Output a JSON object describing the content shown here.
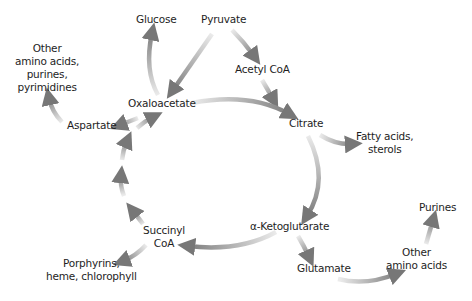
{
  "diagram": {
    "title": "",
    "colors": {
      "background": "#ffffff",
      "text": "#1e1e1e",
      "arrow": "#7a7a7a",
      "arrow_fade": "#e6e6e6"
    },
    "nodes": {
      "glucose": {
        "label": "Glucose"
      },
      "pyruvate": {
        "label": "Pyruvate"
      },
      "acetyl_coa": {
        "label": "Acetyl CoA"
      },
      "other_amino_acids_left": {
        "lines": [
          "Other",
          "amino acids,",
          "purines,",
          "pyrimidines"
        ]
      },
      "oxaloacetate": {
        "label": "Oxaloacetate"
      },
      "aspartate": {
        "label": "Aspartate"
      },
      "citrate": {
        "label": "Citrate"
      },
      "fatty_acids": {
        "lines": [
          "Fatty acids,",
          "sterols"
        ]
      },
      "alpha_ketoglutarate": {
        "label": "α-Ketoglutarate"
      },
      "succinyl_coa": {
        "lines": [
          "Succinyl",
          "CoA"
        ]
      },
      "porphyrins": {
        "lines": [
          "Porphyrins,",
          "heme, chlorophyll"
        ]
      },
      "glutamate": {
        "label": "Glutamate"
      },
      "other_amino_acids_right": {
        "lines": [
          "Other",
          "amino acids"
        ]
      },
      "purines": {
        "label": "Purines"
      }
    },
    "edges": [
      {
        "from": "Pyruvate",
        "to": "Acetyl CoA"
      },
      {
        "from": "Pyruvate",
        "to": "Oxaloacetate"
      },
      {
        "from": "Acetyl CoA",
        "to": "Citrate"
      },
      {
        "from": "Oxaloacetate",
        "to": "Citrate"
      },
      {
        "from": "Oxaloacetate",
        "to": "Glucose"
      },
      {
        "from": "Oxaloacetate",
        "to": "Aspartate"
      },
      {
        "from": "Aspartate",
        "to": "Other amino acids, purines, pyrimidines"
      },
      {
        "from": "Citrate",
        "to": "Fatty acids, sterols"
      },
      {
        "from": "Citrate",
        "to": "α-Ketoglutarate"
      },
      {
        "from": "α-Ketoglutarate",
        "to": "Succinyl CoA"
      },
      {
        "from": "α-Ketoglutarate",
        "to": "Glutamate"
      },
      {
        "from": "Glutamate",
        "to": "Other amino acids"
      },
      {
        "from": "Other amino acids",
        "to": "Purines"
      },
      {
        "from": "Succinyl CoA",
        "to": "Porphyrins, heme, chlorophyll"
      },
      {
        "from": "Succinyl CoA",
        "to": "Oxaloacetate"
      }
    ]
  }
}
